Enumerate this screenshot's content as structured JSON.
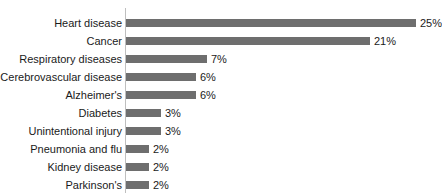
{
  "chart_data": {
    "type": "bar",
    "orientation": "horizontal",
    "title": "",
    "subtitle": "",
    "xlabel": "",
    "ylabel": "",
    "xlim": [
      0,
      27
    ],
    "grid": false,
    "legend": null,
    "value_suffix": "%",
    "bar_color": "#6e6e6e",
    "axis_color": "#bfbfbf",
    "text_color": "#1a1a1a",
    "categories": [
      "Heart disease",
      "Cancer",
      "Respiratory diseases",
      "Cerebrovascular disease",
      "Alzheimer's",
      "Diabetes",
      "Unintentional injury",
      "Pneumonia and flu",
      "Kidney disease",
      "Parkinson's"
    ],
    "values": [
      25,
      21,
      7,
      6,
      6,
      3,
      3,
      2,
      2,
      2
    ],
    "value_labels": [
      "25%",
      "21%",
      "7%",
      "6%",
      "6%",
      "3%",
      "3%",
      "2%",
      "2%",
      "2%"
    ]
  },
  "rows": [
    {
      "label": "Heart disease",
      "value_label": "25%",
      "bar_px": 290,
      "value_x_px": 294
    },
    {
      "label": "Cancer",
      "value_label": "21%",
      "bar_px": 244,
      "value_x_px": 248
    },
    {
      "label": "Respiratory diseases",
      "value_label": "7%",
      "bar_px": 81,
      "value_x_px": 85
    },
    {
      "label": "Cerebrovascular disease",
      "value_label": "6%",
      "bar_px": 70,
      "value_x_px": 74
    },
    {
      "label": "Alzheimer's",
      "value_label": "6%",
      "bar_px": 70,
      "value_x_px": 74
    },
    {
      "label": "Diabetes",
      "value_label": "3%",
      "bar_px": 35,
      "value_x_px": 39
    },
    {
      "label": "Unintentional injury",
      "value_label": "3%",
      "bar_px": 35,
      "value_x_px": 39
    },
    {
      "label": "Pneumonia and flu",
      "value_label": "2%",
      "bar_px": 23,
      "value_x_px": 27
    },
    {
      "label": "Kidney disease",
      "value_label": "2%",
      "bar_px": 23,
      "value_x_px": 27
    },
    {
      "label": "Parkinson's",
      "value_label": "2%",
      "bar_px": 23,
      "value_x_px": 27
    }
  ]
}
